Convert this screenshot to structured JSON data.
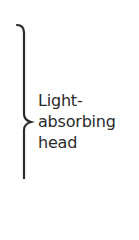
{
  "annotation": {
    "label_lines": [
      "Light-",
      "absorbing",
      "head"
    ],
    "brace_color": "#2a2a2a",
    "text_color": "#2a2a2a"
  }
}
